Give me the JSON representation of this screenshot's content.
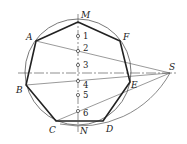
{
  "diagram": {
    "type": "geometric-construction",
    "colors": {
      "stroke": "#222222",
      "thin": "#555555",
      "background": "#ffffff"
    },
    "circle": {
      "cx": 78,
      "cy": 72,
      "r": 53
    },
    "vertices": {
      "M": {
        "label": "M",
        "x": 78,
        "y": 22
      },
      "F": {
        "label": "F",
        "x": 120,
        "y": 41
      },
      "E": {
        "label": "E",
        "x": 130,
        "y": 82
      },
      "D": {
        "label": "D",
        "x": 103,
        "y": 121
      },
      "C": {
        "label": "C",
        "x": 56,
        "y": 121
      },
      "B": {
        "label": "B",
        "x": 26,
        "y": 85
      },
      "A": {
        "label": "A",
        "x": 36,
        "y": 41
      }
    },
    "points": {
      "S": {
        "label": "S",
        "x": 170,
        "y": 73
      },
      "N": {
        "label": "N",
        "x": 78,
        "y": 125
      }
    },
    "divisions": [
      {
        "label": "1",
        "y": 36
      },
      {
        "label": "2",
        "y": 51
      },
      {
        "label": "3",
        "y": 65
      },
      {
        "label": "4",
        "y": 81
      },
      {
        "label": "5",
        "y": 95
      },
      {
        "label": "6",
        "y": 111
      }
    ]
  }
}
